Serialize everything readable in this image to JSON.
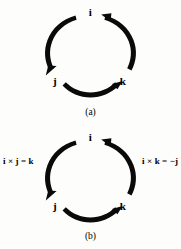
{
  "figure": {
    "background_color": "#fdfdfc",
    "ink_color": "#0a0a0a",
    "panels": [
      {
        "id": "a",
        "caption": "(a)",
        "vectors": {
          "top": "i",
          "bottom_left": "j",
          "bottom_right": "k"
        },
        "cycle": {
          "order": [
            "i",
            "j",
            "k"
          ],
          "direction": "counterclockwise",
          "arrows": [
            {
              "from": "i",
              "to": "j",
              "position": "left-arc",
              "arrowhead": "bottom"
            },
            {
              "from": "j",
              "to": "k",
              "position": "bottom-arc",
              "arrowhead": "right"
            },
            {
              "from": "k",
              "to": "i",
              "position": "right-arc",
              "arrowhead": "top"
            }
          ]
        },
        "equations": []
      },
      {
        "id": "b",
        "caption": "(b)",
        "vectors": {
          "top": "i",
          "bottom_left": "j",
          "bottom_right": "k"
        },
        "cycle": {
          "order": [
            "i",
            "j",
            "k"
          ],
          "direction": "counterclockwise",
          "arrows": [
            {
              "from": "i",
              "to": "j",
              "position": "left-arc",
              "arrowhead": "bottom"
            },
            {
              "from": "j",
              "to": "k",
              "position": "bottom-arc",
              "arrowhead": "right"
            },
            {
              "from": "k",
              "to": "i",
              "position": "right-arc",
              "arrowhead": "top"
            }
          ]
        },
        "equations": [
          {
            "side": "left",
            "text": "i × j = k"
          },
          {
            "side": "right",
            "text": "i × k = −j"
          }
        ]
      }
    ]
  }
}
